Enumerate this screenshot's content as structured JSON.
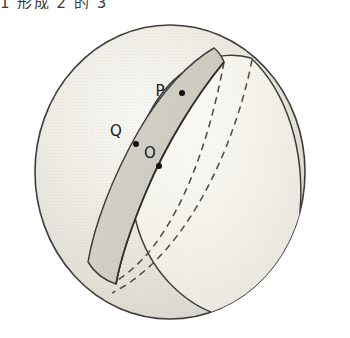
{
  "figure": {
    "title_fragment": "…形成了 O 点…",
    "caption": "",
    "background_color": "#ffffff"
  },
  "header": {
    "partial_text": "1 形成 2 的 3"
  },
  "colors": {
    "outline": "#3b3a36",
    "dashed": "#4a4944",
    "sphere_light": "#f6f5f0",
    "sphere_mid": "#e4e3dc",
    "sphere_shade": "#d6d5cb",
    "wedge_face": "#d2d1c6",
    "lens_face": "#f2f1ea",
    "point_fill": "#111111",
    "label_color": "#1a1a1a"
  },
  "geometry": {
    "sphere": {
      "name": "sphere",
      "center_x": 170,
      "center_y": 172,
      "radius_x": 135,
      "radius_y": 147
    },
    "description": "A sphere with a wedge (lune) removed, revealing two flat semicircular cut faces; the narrow shaded crescent band is the near cut face and the large pale lens is the far cut face."
  },
  "points": [
    {
      "id": "P",
      "label": "P",
      "label_x": 160,
      "label_y": 96,
      "dot_x": 182,
      "dot_y": 93,
      "dot_r": 3.0,
      "note": "point on the rim of the cut face"
    },
    {
      "id": "Q",
      "label": "Q",
      "label_x": 116,
      "label_y": 136,
      "dot_x": 136,
      "dot_y": 144,
      "dot_r": 3.0,
      "note": "point on the rim of the cut face"
    },
    {
      "id": "O",
      "label": "O",
      "label_x": 150,
      "label_y": 158,
      "dot_x": 159,
      "dot_y": 166,
      "dot_r": 3.0,
      "note": "centre of the sphere"
    }
  ],
  "annotations": {
    "solid_edges_label": "visible outline",
    "dashed_edges_label": "hidden great-circle arcs"
  }
}
